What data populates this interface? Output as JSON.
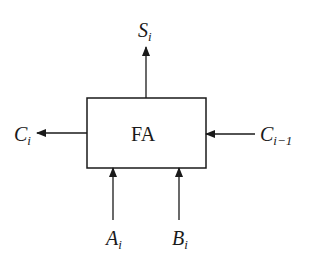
{
  "diagram": {
    "block": {
      "label": "FA"
    },
    "ports": {
      "sum_out": {
        "base": "S",
        "sub": "i",
        "direction": "output"
      },
      "carry_out": {
        "base": "C",
        "sub": "i",
        "direction": "output"
      },
      "carry_in": {
        "base": "C",
        "sub": "i−1",
        "direction": "input"
      },
      "input_a": {
        "base": "A",
        "sub": "i",
        "direction": "input"
      },
      "input_b": {
        "base": "B",
        "sub": "i",
        "direction": "input"
      }
    },
    "colors": {
      "stroke": "#1a1a1a",
      "background": "#ffffff"
    }
  }
}
